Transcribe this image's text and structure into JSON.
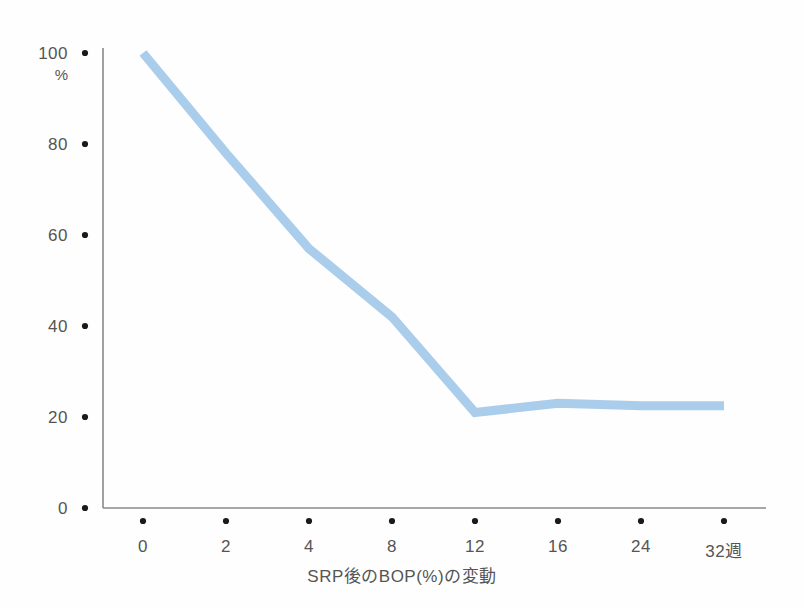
{
  "chart_data": {
    "type": "line",
    "title": "",
    "xlabel": "SRP後のBOP(%)の変動",
    "ylabel": "%",
    "categories": [
      "0",
      "2",
      "4",
      "8",
      "12",
      "16",
      "24",
      "32週"
    ],
    "x_tick_labels": [
      "0",
      "2",
      "4",
      "8",
      "12",
      "16",
      "24",
      "32週"
    ],
    "y_tick_labels": [
      "100",
      "80",
      "60",
      "40",
      "20",
      "0"
    ],
    "y_tick_values": [
      100,
      80,
      60,
      40,
      20,
      0
    ],
    "ylim": [
      0,
      100
    ],
    "grid": false,
    "legend": "none",
    "series": [
      {
        "name": "BOP",
        "values": [
          100,
          78,
          57,
          42,
          21,
          23,
          22.5,
          22.5
        ],
        "color": "#a9cdeb"
      }
    ],
    "line_color": "#a9cdeb",
    "line_width": 9,
    "axis_color": "#8a8a8a",
    "tick_marker": "dot",
    "tick_marker_color": "#1a1a1a"
  },
  "axes": {
    "y_unit": "%",
    "x_title": "SRP後のBOP(%)の変動"
  }
}
